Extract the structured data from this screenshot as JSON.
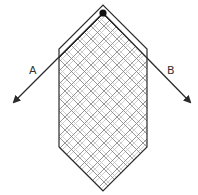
{
  "diagram": {
    "type": "hatched hexagonal shape with pivot and two outgoing arrows",
    "colors": {
      "stroke": "#2b2b2b",
      "hatch_dark": "#8a8a8a",
      "hatch_light": "#c8c8c8",
      "background": "#ffffff"
    },
    "pivot": {
      "label": "pivot-dot"
    },
    "arrows": [
      {
        "label": "A",
        "direction": "down-left"
      },
      {
        "label": "B",
        "direction": "down-right"
      }
    ]
  }
}
